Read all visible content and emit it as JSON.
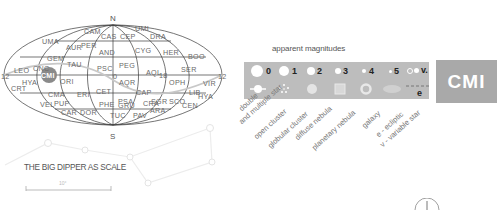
{
  "map": {
    "north_label": "N",
    "south_label": "S",
    "ra_labels": {
      "left": "12",
      "center": "0",
      "right_center": "18",
      "right": "12"
    },
    "highlight": "CMI",
    "constellations": [
      {
        "abbr": "UMI"
      },
      {
        "abbr": "CAM"
      },
      {
        "abbr": "CAS"
      },
      {
        "abbr": "CEP"
      },
      {
        "abbr": "DRA"
      },
      {
        "abbr": "UMA"
      },
      {
        "abbr": "AUR"
      },
      {
        "abbr": "PER"
      },
      {
        "abbr": "AND"
      },
      {
        "abbr": "CYG"
      },
      {
        "abbr": "HER"
      },
      {
        "abbr": "BOO"
      },
      {
        "abbr": "LEO"
      },
      {
        "abbr": "CNC"
      },
      {
        "abbr": "GEM"
      },
      {
        "abbr": "TAU"
      },
      {
        "abbr": "PSC"
      },
      {
        "abbr": "PEG"
      },
      {
        "abbr": "AQL"
      },
      {
        "abbr": "SER"
      },
      {
        "abbr": "HYA"
      },
      {
        "abbr": "ORI"
      },
      {
        "abbr": "AQR"
      },
      {
        "abbr": "OPH"
      },
      {
        "abbr": "VIR"
      },
      {
        "abbr": "CRT"
      },
      {
        "abbr": "CMA"
      },
      {
        "abbr": "ERI"
      },
      {
        "abbr": "CET"
      },
      {
        "abbr": "CAP"
      },
      {
        "abbr": "LIB"
      },
      {
        "abbr": "PSA"
      },
      {
        "abbr": "SGR"
      },
      {
        "abbr": "SCO"
      },
      {
        "abbr": "HYA"
      },
      {
        "abbr": "VEL"
      },
      {
        "abbr": "PUP"
      },
      {
        "abbr": "PHE"
      },
      {
        "abbr": "GRU"
      },
      {
        "abbr": "CRA"
      },
      {
        "abbr": "CEN"
      },
      {
        "abbr": "CAR"
      },
      {
        "abbr": "DOR"
      },
      {
        "abbr": "TUC"
      },
      {
        "abbr": "PAV"
      },
      {
        "abbr": "ARA"
      }
    ]
  },
  "legend": {
    "title": "apparent magnitudes",
    "magnitudes": [
      "0",
      "1",
      "2",
      "3",
      "4",
      "5",
      "v."
    ],
    "ecliptic_symbol": "e",
    "object_types": [
      "double",
      "and multiple star",
      "open cluster",
      "globular cluster",
      "diffuse nebula",
      "planetary nebula",
      "galaxy",
      "e - ecliptic",
      "v - variable star"
    ]
  },
  "badge": {
    "label": "CMI",
    "color": "#a9a9a9"
  },
  "scale": {
    "title": "THE BIG DIPPER AS SCALE",
    "bar_label": "10°"
  }
}
